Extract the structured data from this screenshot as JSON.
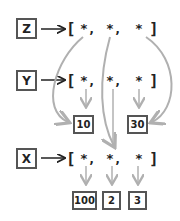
{
  "diagram": {
    "variables": [
      {
        "name": "Z",
        "label": "Z"
      },
      {
        "name": "Y",
        "label": "Y"
      },
      {
        "name": "X",
        "label": "X"
      }
    ],
    "arrays": {
      "z_row": {
        "open": "[",
        "close": "]",
        "elements": [
          "*,",
          "*,",
          "*"
        ]
      },
      "y_row": {
        "open": "[",
        "close": "]",
        "elements": [
          "*,",
          "*,",
          "*"
        ]
      },
      "x_row": {
        "open": "[",
        "close": "]",
        "elements": [
          "*,",
          "*,",
          "*"
        ]
      }
    },
    "values": {
      "y0": "10",
      "y2": "30",
      "x0": "100",
      "x1": "2",
      "x2": "3"
    },
    "colors": {
      "ink": "#222222",
      "box_border": "#555555",
      "pointer_line": "#b0b0b0"
    }
  }
}
